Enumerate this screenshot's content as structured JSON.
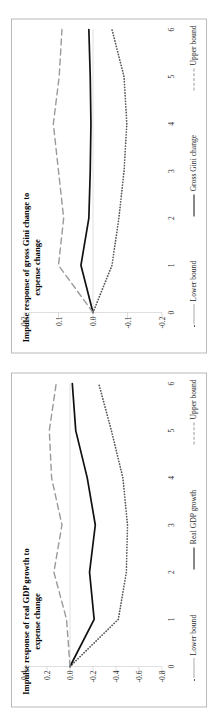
{
  "page": {
    "background": "#ffffff",
    "border_color": "#b9b9b9"
  },
  "colors": {
    "lower_bound": "#595959",
    "main_series": "#111111",
    "upper_bound": "#9a9a9a",
    "axis": "#bfbfbf",
    "text": "#2b2b2b"
  },
  "charts": [
    {
      "id": "gini",
      "title": "Impulse response of gross Gini change to expense change",
      "legend": [
        {
          "label": "Lower bound",
          "style": "dotted"
        },
        {
          "label": "Gross Gini change",
          "style": "solid"
        },
        {
          "label": "Upper bound",
          "style": "dashed"
        }
      ],
      "xticks": [
        "0",
        "1",
        "2",
        "3",
        "4",
        "5",
        "6"
      ],
      "yticks": [
        "0.2",
        "0.1",
        "0.0",
        "-0.1",
        "-0.2"
      ]
    },
    {
      "id": "gdp",
      "title": "Impulse response of real GDP growth to expense change",
      "legend": [
        {
          "label": "Lower bound",
          "style": "dotted"
        },
        {
          "label": "Real GDP growth",
          "style": "solid"
        },
        {
          "label": "Upper bound",
          "style": "dashed"
        }
      ],
      "xticks": [
        "0",
        "1",
        "2",
        "3",
        "4",
        "5",
        "6"
      ],
      "yticks": [
        "0.4",
        "0.2",
        "0.0",
        "-0.2",
        "-0.4",
        "-0.6",
        "-0.8"
      ]
    }
  ],
  "chart_data": [
    {
      "type": "line",
      "title": "Impulse response of gross Gini change to expense change",
      "xlabel": "",
      "ylabel": "",
      "x": [
        0,
        1,
        2,
        3,
        4,
        5,
        6
      ],
      "xlim": [
        0,
        6
      ],
      "ylim": [
        -0.2,
        0.2
      ],
      "yticks": [
        0.2,
        0.1,
        0.0,
        -0.1,
        -0.2
      ],
      "xticks": [
        0,
        1,
        2,
        3,
        4,
        5,
        6
      ],
      "grid": false,
      "legend_position": "bottom",
      "series": [
        {
          "name": "Lower bound",
          "style": "dotted",
          "color": "#595959",
          "values": [
            0.0,
            -0.055,
            -0.075,
            -0.09,
            -0.098,
            -0.09,
            -0.055
          ]
        },
        {
          "name": "Gross Gini change",
          "style": "solid",
          "color": "#111111",
          "values": [
            0.0,
            0.035,
            0.012,
            0.008,
            0.006,
            0.008,
            0.012
          ]
        },
        {
          "name": "Upper bound",
          "style": "dashed",
          "color": "#9a9a9a",
          "values": [
            0.0,
            0.1,
            0.085,
            0.1,
            0.115,
            0.098,
            0.09
          ]
        }
      ]
    },
    {
      "type": "line",
      "title": "Impulse response of real GDP growth to expense change",
      "xlabel": "",
      "ylabel": "",
      "x": [
        0,
        1,
        2,
        3,
        4,
        5,
        6
      ],
      "xlim": [
        0,
        6
      ],
      "ylim": [
        -0.8,
        0.4
      ],
      "yticks": [
        0.4,
        0.2,
        0.0,
        -0.2,
        -0.4,
        -0.6,
        -0.8
      ],
      "xticks": [
        0,
        1,
        2,
        3,
        4,
        5,
        6
      ],
      "grid": false,
      "legend_position": "bottom",
      "series": [
        {
          "name": "Lower bound",
          "style": "dotted",
          "color": "#595959",
          "values": [
            0.0,
            -0.42,
            -0.49,
            -0.5,
            -0.46,
            -0.36,
            -0.25
          ]
        },
        {
          "name": "Real GDP growth",
          "style": "solid",
          "color": "#111111",
          "values": [
            0.0,
            -0.21,
            -0.17,
            -0.22,
            -0.15,
            -0.05,
            -0.02
          ]
        },
        {
          "name": "Upper bound",
          "style": "dashed",
          "color": "#9a9a9a",
          "values": [
            0.0,
            0.03,
            0.14,
            0.07,
            0.16,
            0.18,
            0.12
          ]
        }
      ]
    }
  ]
}
